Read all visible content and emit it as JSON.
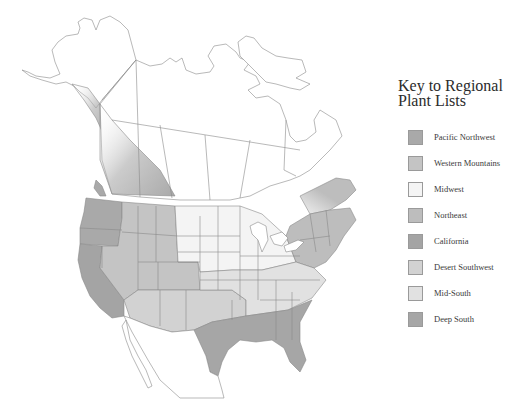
{
  "legend": {
    "title_line1": "Key to Regional",
    "title_line2": "Plant Lists",
    "items": [
      {
        "label": "Pacific Northwest",
        "color": "#a9a9a9"
      },
      {
        "label": "Western Mountains",
        "color": "#c4c4c4"
      },
      {
        "label": "Midwest",
        "color": "#f4f4f4"
      },
      {
        "label": "Northeast",
        "color": "#bdbdbd"
      },
      {
        "label": "California",
        "color": "#a4a4a4"
      },
      {
        "label": "Desert Southwest",
        "color": "#d2d2d2"
      },
      {
        "label": "Mid-South",
        "color": "#e1e1e1"
      },
      {
        "label": "Deep South",
        "color": "#a6a6a6"
      }
    ]
  },
  "map": {
    "subject": "North America regional plant list map",
    "outline_color": "#8a8a8a",
    "unshaded_color": "#ffffff"
  }
}
